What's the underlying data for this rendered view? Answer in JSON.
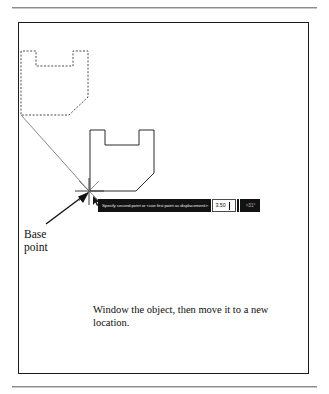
{
  "figure": {
    "caption": "Window the object, then move it to a new location.",
    "annotation": {
      "base_point_label": "Base\npoint"
    },
    "dynamic_input": {
      "prompt": "Specify second point or <use first point as displacement>:",
      "distance_value": "3.50",
      "angle_value": "<31°",
      "prompt_bg": "#121212",
      "prompt_fg": "#e6e6e6",
      "field_bg": "#fdfdfd",
      "field_border": "#4a4a4a"
    },
    "geometry": {
      "ghost_object_style": "dashed",
      "ghost_object_name": "selected-object-ghost",
      "solid_object_style": "solid",
      "solid_object_name": "source-object",
      "displacement_line": "base-point-to-destination",
      "cursor": "crosshair-pickbox"
    },
    "colors": {
      "line": "#1c1c1c",
      "ghost_line": "#4d4d4d",
      "frame": "#1c1c1c",
      "rule": "#8d8d8d",
      "page_background": "#ffffff"
    }
  }
}
